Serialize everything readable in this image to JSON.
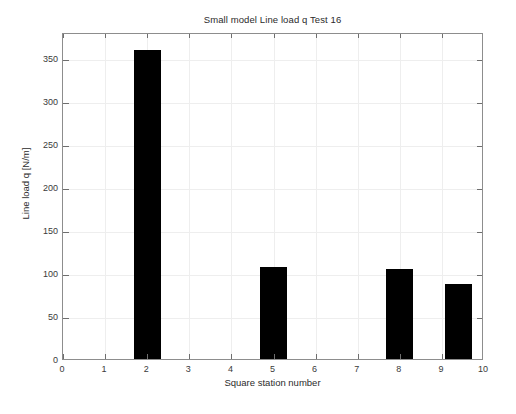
{
  "chart_data": {
    "type": "bar",
    "title": "Small model Line load q Test 16",
    "xlabel": "Square station number",
    "ylabel": "Line load q [N/m]",
    "xlim": [
      0,
      10
    ],
    "ylim": [
      0,
      380
    ],
    "grid": true,
    "legend": null,
    "bar_color": "#000000",
    "x": [
      2,
      5,
      8,
      9.4
    ],
    "values": [
      361,
      109,
      107,
      89
    ],
    "bar_width": 0.65,
    "categories": [
      "2",
      "5",
      "8",
      "9.4"
    ],
    "xticks": [
      0,
      1,
      2,
      3,
      4,
      5,
      6,
      7,
      8,
      9,
      10
    ],
    "xticklabels": [
      "0",
      "1",
      "2",
      "3",
      "4",
      "5",
      "6",
      "7",
      "8",
      "9",
      "10"
    ],
    "yticks": [
      0,
      50,
      100,
      150,
      200,
      250,
      300,
      350
    ],
    "yticklabels": [
      "0",
      "50",
      "100",
      "150",
      "200",
      "250",
      "300",
      "350"
    ],
    "bars": [
      {
        "name": "station-2",
        "x": 2,
        "value": 361
      },
      {
        "name": "station-5",
        "x": 5,
        "value": 109
      },
      {
        "name": "station-8",
        "x": 8,
        "value": 107
      },
      {
        "name": "station-9",
        "x": 9.4,
        "value": 89
      }
    ]
  }
}
